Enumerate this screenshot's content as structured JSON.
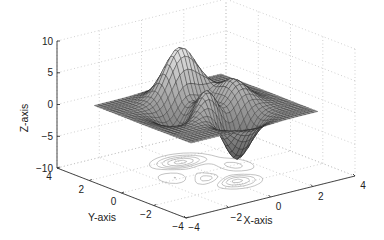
{
  "chart_data": {
    "type": "surface",
    "subtype": "surfc (surface with contour projection)",
    "function": "peaks",
    "title": "",
    "xlabel": "X-axis",
    "ylabel": "Y-axis",
    "zlabel": "Z-axis",
    "xlim": [
      -4,
      4
    ],
    "ylim": [
      -4,
      4
    ],
    "zlim": [
      -10,
      10
    ],
    "xticks": [
      -4,
      -2,
      0,
      2,
      4
    ],
    "yticks": [
      -4,
      -2,
      0,
      2,
      4
    ],
    "zticks": [
      -10,
      -5,
      0,
      5,
      10
    ],
    "xtick_labels": [
      "−4",
      "−2",
      "0",
      "2",
      "4"
    ],
    "ytick_labels": [
      "−4",
      "−2",
      "0",
      "2",
      "4"
    ],
    "ztick_labels": [
      "−10",
      "−5",
      "0",
      "5",
      "10"
    ],
    "grid": true,
    "colormap": "gray",
    "surface_extent": [
      -3,
      3
    ],
    "grid_resolution": 33,
    "peaks_summary": [
      {
        "feature": "max peak",
        "x": -0.0,
        "y": 1.6,
        "z": 8.1
      },
      {
        "feature": "secondary peak",
        "x": -0.5,
        "y": -0.6,
        "z": 3.8
      },
      {
        "feature": "min trough",
        "x": 0.2,
        "y": -1.6,
        "z": -6.5
      },
      {
        "feature": "local min",
        "x": -1.3,
        "y": 0.2,
        "z": -3.0
      }
    ]
  },
  "axes": {
    "x_label": "X-axis",
    "y_label": "Y-axis",
    "z_label": "Z-axis"
  }
}
